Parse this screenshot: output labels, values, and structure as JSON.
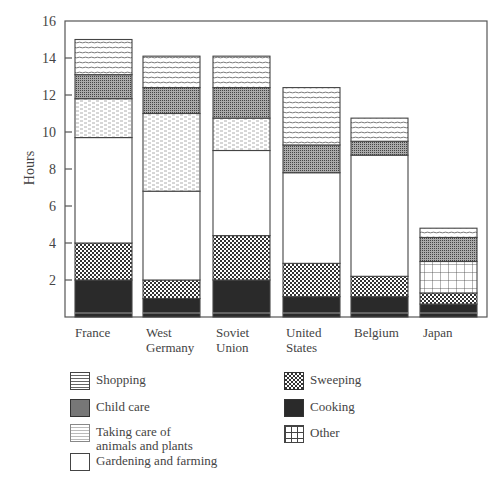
{
  "chart_data": {
    "type": "bar",
    "stacked": true,
    "title": "",
    "xlabel": "",
    "ylabel": "Hours",
    "ylim": [
      0,
      16
    ],
    "yticks": [
      2,
      4,
      6,
      8,
      10,
      12,
      14,
      16
    ],
    "grid": false,
    "legend_position": "bottom",
    "categories": [
      "France",
      "West\nGermany",
      "Soviet\nUnion",
      "United\nStates",
      "Belgium",
      "Japan"
    ],
    "series": [
      {
        "name": "Cooking",
        "pattern": "solid-dark",
        "values": [
          2.0,
          1.0,
          2.0,
          1.1,
          1.1,
          0.7
        ]
      },
      {
        "name": "Sweeping",
        "pattern": "checker",
        "values": [
          2.0,
          1.0,
          2.4,
          1.8,
          1.1,
          0.6
        ]
      },
      {
        "name": "Other",
        "pattern": "grid",
        "values": [
          0,
          0,
          0,
          0,
          0,
          1.7
        ]
      },
      {
        "name": "Gardening and farming",
        "pattern": "white",
        "values": [
          5.7,
          4.8,
          4.6,
          4.9,
          6.55,
          0
        ]
      },
      {
        "name": "Taking care of\nanimals and plants",
        "pattern": "dashed",
        "values": [
          2.1,
          4.2,
          1.75,
          0,
          0,
          0
        ]
      },
      {
        "name": "Child care",
        "pattern": "dense-dots",
        "values": [
          1.3,
          1.4,
          1.65,
          1.5,
          0.75,
          1.3
        ]
      },
      {
        "name": "Shopping",
        "pattern": "hlines",
        "values": [
          1.9,
          1.7,
          1.7,
          3.1,
          1.25,
          0.5
        ]
      }
    ],
    "totals": [
      15.0,
      14.1,
      14.1,
      12.4,
      10.75,
      4.8
    ]
  },
  "legend": {
    "items": [
      {
        "label": "Shopping",
        "pattern": "hlines",
        "x": 70,
        "y": 372
      },
      {
        "label": "Child care",
        "pattern": "dense-dots",
        "x": 70,
        "y": 399
      },
      {
        "label": "Taking care of\nanimals and plants",
        "pattern": "dashed",
        "x": 70,
        "y": 424
      },
      {
        "label": "Gardening and farming",
        "pattern": "white",
        "x": 70,
        "y": 453
      },
      {
        "label": "Sweeping",
        "pattern": "checker",
        "x": 284,
        "y": 372
      },
      {
        "label": "Cooking",
        "pattern": "solid-dark",
        "x": 284,
        "y": 399
      },
      {
        "label": "Other",
        "pattern": "grid",
        "x": 284,
        "y": 425
      }
    ]
  },
  "axis": {
    "ylabel": "Hours"
  }
}
